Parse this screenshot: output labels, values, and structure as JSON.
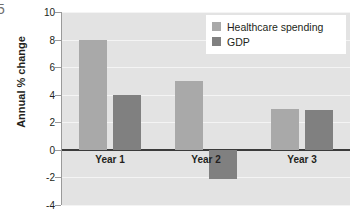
{
  "figure_number": "5",
  "chart_data": {
    "type": "bar",
    "title": "",
    "xlabel": "",
    "ylabel": "Annual % change",
    "categories": [
      "Year 1",
      "Year 2",
      "Year 3"
    ],
    "series": [
      {
        "name": "Healthcare spending",
        "color": "#a9a9a9",
        "values": [
          8,
          5,
          3
        ]
      },
      {
        "name": "GDP",
        "color": "#808080",
        "values": [
          4,
          -2.1,
          2.9
        ]
      }
    ],
    "ylim": [
      -4,
      10
    ],
    "yticks": [
      10,
      8,
      6,
      4,
      2,
      0,
      -2,
      -4
    ],
    "ytick_labels": [
      "10",
      "8",
      "6",
      "4",
      "2",
      "0",
      "-2",
      "-4"
    ],
    "grid": true,
    "gridline_color": "#f4f4f4",
    "zero_line_color": "#3b3b3b",
    "plot_background": "#e3e3e3",
    "legend_position": "top-right",
    "legend_background": "#ffffff"
  }
}
